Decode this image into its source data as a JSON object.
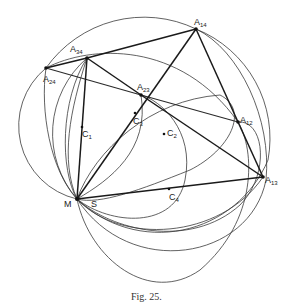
{
  "figure": {
    "caption": "Fig. 25.",
    "points": [
      {
        "id": "A34",
        "label": "A",
        "sub": "34"
      },
      {
        "id": "A24",
        "label": "A",
        "sub": "24"
      },
      {
        "id": "A14",
        "label": "A",
        "sub": "14"
      },
      {
        "id": "A23",
        "label": "A",
        "sub": "23"
      },
      {
        "id": "A12",
        "label": "A",
        "sub": "12"
      },
      {
        "id": "A13",
        "label": "A",
        "sub": "13"
      },
      {
        "id": "C1",
        "label": "C",
        "sub": "1"
      },
      {
        "id": "C2",
        "label": "C",
        "sub": "2"
      },
      {
        "id": "C3",
        "label": "C",
        "sub": "3"
      },
      {
        "id": "C4",
        "label": "C",
        "sub": "4"
      },
      {
        "id": "M",
        "label": "M",
        "sub": ""
      },
      {
        "id": "S",
        "label": "S",
        "sub": ""
      }
    ]
  }
}
